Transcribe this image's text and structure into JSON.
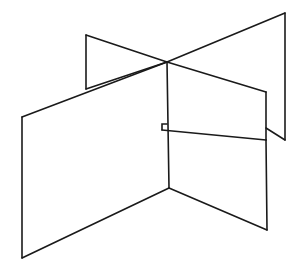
{
  "figure": {
    "kind": "line-drawing",
    "canvas": {
      "width": 303,
      "height": 279
    },
    "style": {
      "background_color": "#ffffff",
      "stroke_color": "#1a1a1a",
      "stroke_width": 1.6,
      "fill_color": "#ffffff"
    },
    "key_points": {
      "center_crossing": [
        167,
        62
      ],
      "bottom_center_vertex": [
        169,
        188
      ],
      "notch_top": [
        167,
        124
      ],
      "notch_step": [
        162,
        130
      ]
    },
    "panels": [
      {
        "name": "front-left-panel",
        "label": "Front left quadrilateral panel",
        "points": "22,117 167,62 169,188 22,258"
      },
      {
        "name": "back-left-wing",
        "label": "Back left triangular wing",
        "points": "86,35 167,62 86,89"
      },
      {
        "name": "back-right-panel",
        "label": "Back right quadrilateral panel",
        "points": "167,62 285,13 285,140 266,92"
      },
      {
        "name": "front-right-panel",
        "label": "Front right quadrilateral panel",
        "points": "162,130 266,140 267,230 169,188"
      }
    ],
    "edges": [
      {
        "name": "edge-front-left-top",
        "d": "M 22,117 L 167,62"
      },
      {
        "name": "edge-front-left-vertical-left",
        "d": "M 22,117 L 22,258"
      },
      {
        "name": "edge-front-left-bottom",
        "d": "M 22,258 L 169,188"
      },
      {
        "name": "edge-front-left-vertical-center",
        "d": "M 169,188 L 167,62"
      },
      {
        "name": "edge-back-left-wing-upper",
        "d": "M 86,35 L 167,62"
      },
      {
        "name": "edge-back-left-wing-vertical",
        "d": "M 86,35 L 86,89"
      },
      {
        "name": "edge-back-left-wing-lower",
        "d": "M 86,89 L 167,62"
      },
      {
        "name": "edge-back-right-upper",
        "d": "M 167,62 L 285,13"
      },
      {
        "name": "edge-back-right-far-vertical",
        "d": "M 285,13 L 285,140"
      },
      {
        "name": "edge-back-right-lower",
        "d": "M 285,140 L 266,128"
      },
      {
        "name": "edge-back-right-inner-upper",
        "d": "M 167,62 L 266,92"
      },
      {
        "name": "edge-back-right-inner-vertical",
        "d": "M 266,92 L 266,140"
      },
      {
        "name": "edge-notch-step-horizontal",
        "d": "M 167,124 L 162,124 L 162,130"
      },
      {
        "name": "edge-front-right-top",
        "d": "M 162,130 L 266,140"
      },
      {
        "name": "edge-front-right-vertical",
        "d": "M 266,140 L 267,230"
      },
      {
        "name": "edge-front-right-bottom",
        "d": "M 267,230 L 169,188"
      }
    ]
  }
}
